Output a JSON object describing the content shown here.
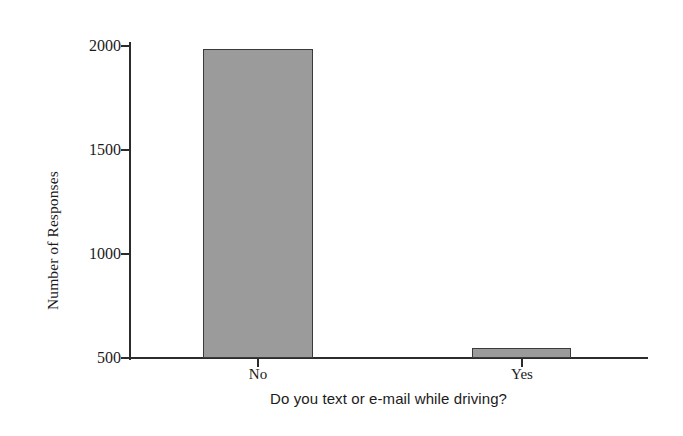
{
  "chart_data": {
    "type": "bar",
    "title": "",
    "subtitle": "",
    "xlabel": "Do you text or e-mail while driving?",
    "ylabel": "Number of Responses",
    "categories": [
      "No",
      "Yes"
    ],
    "values": [
      1980,
      550
    ],
    "ylim": [
      500,
      2100
    ],
    "y_axis_base": 500,
    "yticks": [
      500,
      1000,
      1500,
      2000
    ],
    "ytick_labels": [
      "500",
      "1000",
      "1500",
      "2000"
    ],
    "grid": false,
    "legend": null,
    "series": [
      {
        "name": "Number of Responses",
        "values": [
          1980,
          550
        ]
      }
    ],
    "annotations": [],
    "colors": {
      "bar_fill": "#9b9b9b",
      "bar_outline": "#3a3a3a",
      "axis": "#2c2c2c",
      "text": "#1b1b1b",
      "background": "#ffffff"
    }
  }
}
